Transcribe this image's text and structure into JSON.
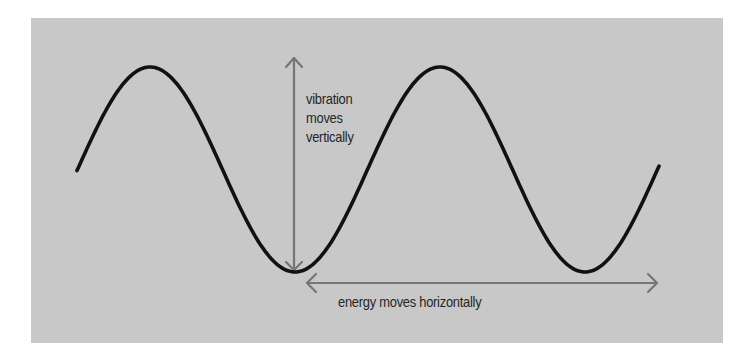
{
  "diagram": {
    "type": "transverse-wave",
    "colors": {
      "background": "#c8c8c8",
      "wave": "#111111",
      "arrow": "#767676",
      "text": "#262626"
    },
    "wave": {
      "start_x": 77,
      "end_x": 659,
      "center_y": 169.5,
      "amplitude": 102.5,
      "wavelength": 290,
      "peaks_x": [
        150,
        440
      ],
      "troughs_x": [
        295,
        587
      ]
    },
    "labels": {
      "vertical": [
        "vibration",
        "moves",
        "vertically"
      ],
      "horizontal": "energy moves horizontally"
    }
  }
}
